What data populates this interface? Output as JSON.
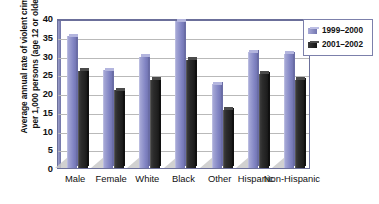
{
  "chart_data": {
    "type": "bar",
    "title": "",
    "xlabel": "",
    "ylabel": "Average annual rate of violent crimes per 1,000 persons (age 12 or older)",
    "ylabel_lines": [
      "Average annual rate of violent crimes",
      "per 1,000 persons (age 12 or older)"
    ],
    "categories": [
      "Male",
      "Female",
      "White",
      "Black",
      "Other",
      "Hispanic",
      "Non-Hispanic"
    ],
    "series": [
      {
        "name": "1999–2000",
        "color": "#8b8dc8",
        "values": [
          35.2,
          26.1,
          29.7,
          39.2,
          22.4,
          30.9,
          30.5
        ]
      },
      {
        "name": "2001–2002",
        "color": "#222222",
        "values": [
          25.9,
          20.7,
          23.5,
          28.9,
          15.6,
          25.2,
          23.5
        ]
      }
    ],
    "ylim": [
      0,
      40
    ],
    "yticks": [
      0,
      5,
      10,
      15,
      20,
      25,
      30,
      35,
      40
    ],
    "ytick_labels": [
      "0",
      "5",
      "10",
      "15",
      "20",
      "25",
      "30",
      "35",
      "40"
    ],
    "grid": true,
    "grid_axis": "y",
    "legend_position": "right",
    "legend_entries": [
      "1999–2000",
      "2001–2002"
    ],
    "background_color": "#ffffff",
    "plot_border_color": "#6b6f9a",
    "gridline_color": "#b9b9b9"
  }
}
